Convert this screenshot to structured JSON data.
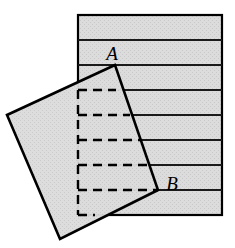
{
  "figure": {
    "name": "folded-paper-square-figure",
    "type": "geometry-diagram",
    "width": 235,
    "height": 248,
    "background_color": "#ffffff"
  },
  "colors": {
    "paper_fill": "#d9d9d9",
    "square_fill": "#d6d6d6",
    "stroke": "#000000",
    "rule_line": "#1a1a1a",
    "dashed_line": "#000000",
    "background": "#ffffff"
  },
  "labels": {
    "point_a": "A",
    "point_b": "B"
  },
  "label_positions": {
    "point_a": {
      "x": 112,
      "y": 60
    },
    "point_b": {
      "x": 172,
      "y": 190
    }
  },
  "lined_paper": {
    "name": "lined-paper-sheet",
    "left": 78,
    "right": 222,
    "top": 15,
    "bottom": 215,
    "stroke_width": 2.2,
    "rule_spacing": 25,
    "rule_y_positions": [
      40,
      65,
      90,
      115,
      140,
      165,
      190
    ],
    "rule_stroke_width": 2.2,
    "band_count": 8
  },
  "rotated_square": {
    "name": "rotated-square-overlay",
    "stroke_width": 2.6,
    "vertices": [
      {
        "label": "A",
        "x": 115,
        "y": 65
      },
      {
        "label": "top-left",
        "x": 7,
        "y": 115
      },
      {
        "label": "bottom-left",
        "x": 60,
        "y": 239
      },
      {
        "label": "B-corner",
        "x": 158,
        "y": 190
      }
    ]
  },
  "hidden_rules": {
    "name": "hidden-rule-dashed-lines",
    "stroke_width": 2.4,
    "dash_pattern": "9 6",
    "vertical_left_x": 78,
    "vertical_from_y": 90,
    "vertical_to_y": 215,
    "segments": [
      {
        "y": 90,
        "x1": 78,
        "x2": 116
      },
      {
        "y": 115,
        "x1": 78,
        "x2": 130
      },
      {
        "y": 140,
        "x1": 78,
        "x2": 141
      },
      {
        "y": 165,
        "x1": 78,
        "x2": 152
      },
      {
        "y": 190,
        "x1": 78,
        "x2": 158
      },
      {
        "y": 215,
        "x1": 78,
        "x2": 95
      }
    ]
  }
}
